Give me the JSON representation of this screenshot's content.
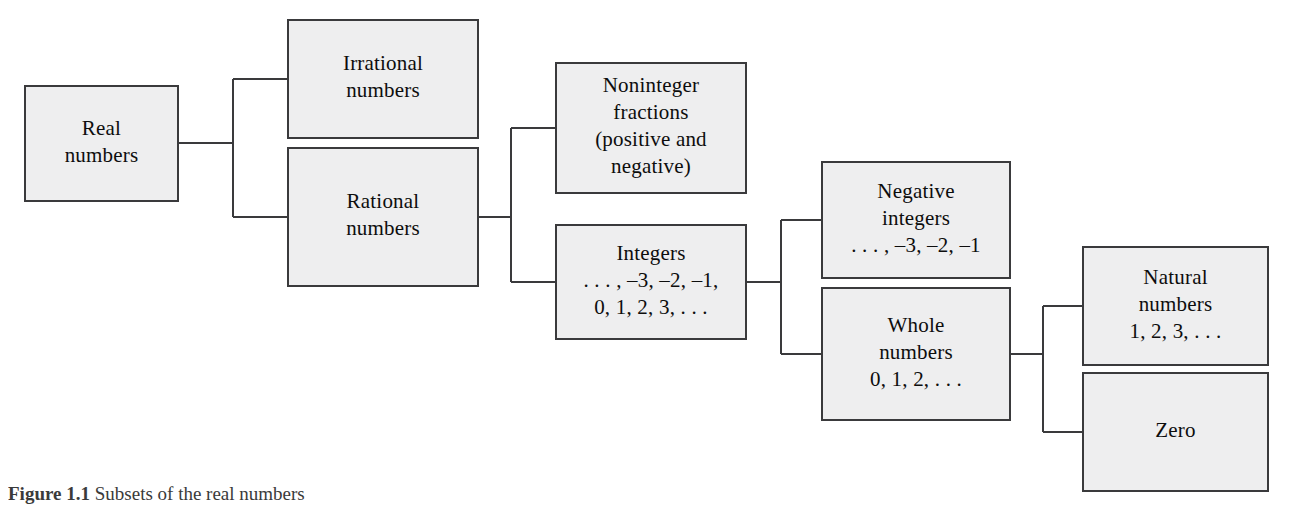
{
  "figure": {
    "caption_label": "Figure 1.1",
    "caption_body": "Subsets of the real numbers",
    "background_color": "#ffffff",
    "box_fill_color": "#eeeeef",
    "box_border_color": "#3a3a3c",
    "connector_color": "#3a3a3c",
    "text_color": "#0d0d0d"
  },
  "nodes": [
    {
      "id": "real-numbers",
      "name": "real-numbers-box",
      "x": 25,
      "y": 86,
      "w": 153,
      "h": 115,
      "lines": [
        "Real",
        "numbers"
      ]
    },
    {
      "id": "irrational-numbers",
      "name": "irrational-numbers-box",
      "x": 288,
      "y": 20,
      "w": 190,
      "h": 118,
      "lines": [
        "Irrational",
        "numbers"
      ]
    },
    {
      "id": "rational-numbers",
      "name": "rational-numbers-box",
      "x": 288,
      "y": 148,
      "w": 190,
      "h": 138,
      "lines": [
        "Rational",
        "numbers"
      ]
    },
    {
      "id": "noninteger-fractions",
      "name": "noninteger-fractions-box",
      "x": 556,
      "y": 63,
      "w": 190,
      "h": 130,
      "lines": [
        "Noninteger",
        "fractions",
        "(positive and",
        "negative)"
      ]
    },
    {
      "id": "integers",
      "name": "integers-box",
      "x": 556,
      "y": 225,
      "w": 190,
      "h": 114,
      "lines": [
        "Integers",
        ". . . , –3, –2, –1,",
        "0, 1, 2, 3, . . ."
      ]
    },
    {
      "id": "negative-integers",
      "name": "negative-integers-box",
      "x": 822,
      "y": 162,
      "w": 188,
      "h": 116,
      "lines": [
        "Negative",
        "integers",
        ". . . , –3, –2, –1"
      ]
    },
    {
      "id": "whole-numbers",
      "name": "whole-numbers-box",
      "x": 822,
      "y": 288,
      "w": 188,
      "h": 132,
      "lines": [
        "Whole",
        "numbers",
        "0, 1, 2, . . ."
      ]
    },
    {
      "id": "natural-numbers",
      "name": "natural-numbers-box",
      "x": 1083,
      "y": 247,
      "w": 185,
      "h": 118,
      "lines": [
        "Natural",
        "numbers",
        "1, 2, 3, . . ."
      ]
    },
    {
      "id": "zero",
      "name": "zero-box",
      "x": 1083,
      "y": 373,
      "w": 185,
      "h": 118,
      "lines": [
        "Zero"
      ]
    }
  ],
  "connectors": [
    {
      "id": "real-to-children",
      "name": "connector-real-to-rational-irrational",
      "parent": "real-numbers",
      "children": [
        "irrational-numbers",
        "rational-numbers"
      ],
      "path": "M 178 143 L 233 143 M 233 79 L 233 217 M 233 79 L 288 79 M 233 217 L 288 217"
    },
    {
      "id": "rational-to-children",
      "name": "connector-rational-to-fractions-integers",
      "parent": "rational-numbers",
      "children": [
        "noninteger-fractions",
        "integers"
      ],
      "path": "M 478 217 L 511 217 M 511 128 L 511 282 M 511 128 L 556 128 M 511 282 L 556 282"
    },
    {
      "id": "integers-to-children",
      "name": "connector-integers-to-negative-whole",
      "parent": "integers",
      "children": [
        "negative-integers",
        "whole-numbers"
      ],
      "path": "M 746 282 L 781 282 M 781 220 L 781 354 M 781 220 L 822 220 M 781 354 L 822 354"
    },
    {
      "id": "whole-to-children",
      "name": "connector-whole-to-natural-zero",
      "parent": "whole-numbers",
      "children": [
        "natural-numbers",
        "zero"
      ],
      "path": "M 1010 354 L 1043 354 M 1043 306 L 1043 432 M 1043 306 L 1083 306 M 1043 432 L 1083 432"
    }
  ]
}
